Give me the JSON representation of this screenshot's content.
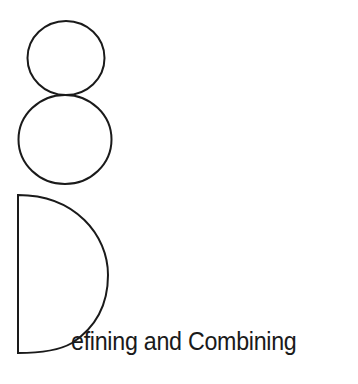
{
  "chapter": {
    "number": "8",
    "drop_cap": "D",
    "title_rest": "efining and Combining",
    "title_full": "Defining and Combining"
  },
  "colors": {
    "ink": "#1a1a1a",
    "background": "#ffffff"
  }
}
